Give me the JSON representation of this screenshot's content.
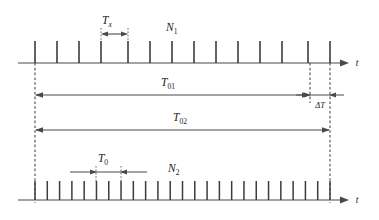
{
  "figure": {
    "background_color": "#ffffff",
    "line_color": "#4a4a4a",
    "pulse_color": "#3c3c3c",
    "text_color": "#1d1d1d"
  },
  "labels": {
    "tx_symbol": "T",
    "tx_subscript": "x",
    "n1_symbol": "N",
    "n1_subscript": "1",
    "t01_symbol": "T",
    "t01_subscript": "01",
    "delta_t": "ΔT",
    "t02_symbol": "T",
    "t02_subscript": "02",
    "t0_symbol": "T",
    "t0_subscript": "0",
    "n2_symbol": "N",
    "n2_subscript": "2",
    "axis_top": "t",
    "axis_bottom": "t"
  },
  "chart_data": {
    "type": "line",
    "xlabel": "t",
    "ylabel": "",
    "grid": false,
    "legend": "none",
    "series": [
      {
        "name": "N1 pulse train",
        "label": "N1",
        "axis_y": 63,
        "pulse_height": 22,
        "count": 14,
        "x_start": 35,
        "x_end": 330,
        "pulse_x": [
          35,
          57,
          79,
          101,
          128,
          150,
          172,
          194,
          216,
          238,
          260,
          282,
          308,
          330
        ]
      },
      {
        "name": "N2 pulse train",
        "label": "N2",
        "axis_y": 200,
        "pulse_height": 19,
        "count": 25,
        "x_start": 35,
        "x_end": 330,
        "pulse_spacing": 12.3
      }
    ],
    "annotations": [
      {
        "name": "Tx",
        "label": "T_x",
        "type": "dimension",
        "from_x": 101,
        "to_x": 128,
        "y": 34,
        "arrows": "outward",
        "guide_from_y": 40,
        "guide_to_y": 63
      },
      {
        "name": "T01",
        "label": "T_01",
        "type": "dimension",
        "from_x": 35,
        "to_x": 310,
        "y": 95,
        "arrows": "outward"
      },
      {
        "name": "deltaT",
        "label": "ΔT",
        "type": "dimension",
        "from_x": 310,
        "to_x": 330,
        "y": 95,
        "arrows": "inward"
      },
      {
        "name": "T02",
        "label": "T_02",
        "type": "dimension",
        "from_x": 35,
        "to_x": 330,
        "y": 130,
        "arrows": "outward"
      },
      {
        "name": "T0",
        "label": "T_0",
        "type": "dimension",
        "from_x": 96,
        "to_x": 121,
        "y": 172,
        "arrows": "inward",
        "guide_from_y": 176,
        "guide_to_y": 200
      }
    ],
    "guides": [
      {
        "name": "left-reference",
        "x": 35,
        "from_y": 63,
        "to_y": 200,
        "style": "dashed"
      },
      {
        "name": "t01-end-reference",
        "x": 310,
        "from_y": 63,
        "to_y": 100,
        "style": "dashed"
      },
      {
        "name": "t02-end-reference",
        "x": 330,
        "from_y": 63,
        "to_y": 200,
        "style": "dashed"
      }
    ]
  }
}
